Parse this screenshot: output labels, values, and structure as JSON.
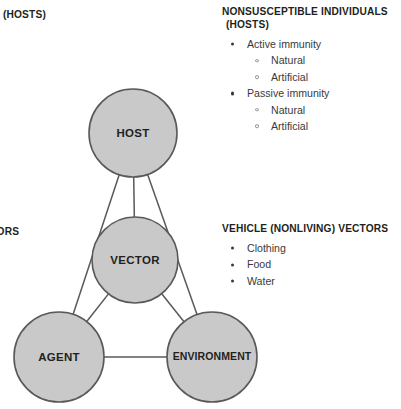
{
  "figure": {
    "background_color": "#ffffff",
    "node_fill_color": "#c9c9c9",
    "node_stroke_color": "#58595b",
    "text_color": "#231f20",
    "body_text_color": "#3a3a3c"
  },
  "diagram": {
    "nodes": [
      {
        "id": "host",
        "label": "HOST",
        "cx": 133,
        "cy": 133,
        "r": 44
      },
      {
        "id": "vector",
        "label": "VECTOR",
        "cx": 135,
        "cy": 260,
        "r": 43
      },
      {
        "id": "agent",
        "label": "AGENT",
        "cx": 59,
        "cy": 357,
        "r": 45
      },
      {
        "id": "environment",
        "label": "ENVIRONMENT",
        "cx": 212,
        "cy": 357,
        "r": 45
      }
    ],
    "links": [
      {
        "from": "host",
        "to": "vector"
      },
      {
        "from": "host",
        "to": "agent"
      },
      {
        "from": "host",
        "to": "environment"
      },
      {
        "from": "vector",
        "to": "agent"
      },
      {
        "from": "vector",
        "to": "environment"
      },
      {
        "from": "agent",
        "to": "environment"
      }
    ]
  },
  "labels": {
    "hosts_top_left": "(HOSTS)",
    "vectors_left": "VECTORS"
  },
  "nonsusceptible": {
    "heading_line1": "NONSUSCEPTIBLE INDIVIDUALS",
    "heading_line2": "(HOSTS)",
    "items": [
      {
        "level": 1,
        "text": "Active immunity"
      },
      {
        "level": 2,
        "text": "Natural"
      },
      {
        "level": 2,
        "text": "Artificial"
      },
      {
        "level": 1,
        "text": "Passive immunity"
      },
      {
        "level": 2,
        "text": "Natural"
      },
      {
        "level": 2,
        "text": "Artificial"
      }
    ]
  },
  "vehicle_vectors": {
    "heading": "VEHICLE (NONLIVING) VECTORS",
    "items": [
      {
        "level": 1,
        "text": "Clothing"
      },
      {
        "level": 1,
        "text": "Food"
      },
      {
        "level": 1,
        "text": "Water"
      }
    ]
  }
}
